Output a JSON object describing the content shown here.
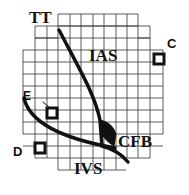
{
  "diagram": {
    "labels": {
      "tt": "TT",
      "ias": "IAS",
      "cfb": "CFB",
      "ivs": "IVS",
      "c": "C",
      "d": "D",
      "e": "E"
    },
    "colors": {
      "grid": "#333333",
      "stroke": "#111111",
      "background": "#ffffff"
    }
  }
}
